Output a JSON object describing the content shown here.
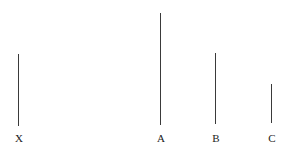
{
  "diagram": {
    "lines": [
      {
        "label": "X",
        "x": 18,
        "y_top": 54,
        "y_bottom": 126,
        "length": 72
      },
      {
        "label": "A",
        "x": 160,
        "y_top": 13,
        "y_bottom": 125,
        "length": 112
      },
      {
        "label": "B",
        "x": 215,
        "y_top": 53,
        "y_bottom": 124,
        "length": 71
      },
      {
        "label": "C",
        "x": 271,
        "y_top": 84,
        "y_bottom": 123,
        "length": 39
      }
    ],
    "label_y": 133,
    "line_color": "#3a3a3a",
    "label_color": "#222222"
  }
}
